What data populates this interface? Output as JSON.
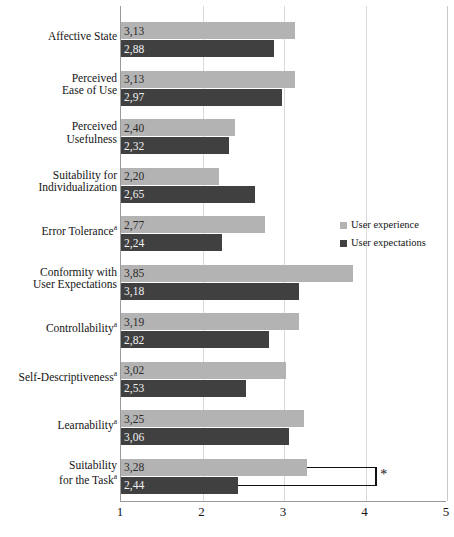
{
  "chart_data": {
    "type": "bar",
    "orientation": "horizontal",
    "title": "",
    "xlabel": "",
    "ylabel": "",
    "xlim": [
      1,
      5
    ],
    "xticks": [
      "1",
      "2",
      "3",
      "4",
      "5"
    ],
    "grid": true,
    "legend_position": "right-middle",
    "categories": [
      "Affective State",
      "Perceived\nEase of Use",
      "Perceived\nUsefulness",
      "Suitability for\nIndividualization",
      "Error Tolerance",
      "Conformity with\nUser Expectations",
      "Controllability",
      "Self-Descriptiveness",
      "Learnability",
      "Suitability\nfor the Task"
    ],
    "category_superscripts": [
      "",
      "",
      "",
      "",
      "a",
      "",
      "a",
      "a",
      "a",
      "a"
    ],
    "series": [
      {
        "name": "User experience",
        "color": "#b3b3b3",
        "values": [
          3.13,
          3.13,
          2.4,
          2.2,
          2.77,
          3.85,
          3.19,
          3.02,
          3.25,
          3.28
        ],
        "labels": [
          "3,13",
          "3,13",
          "2,40",
          "2,20",
          "2,77",
          "3,85",
          "3,19",
          "3,02",
          "3,25",
          "3,28"
        ]
      },
      {
        "name": "User expectations",
        "color": "#404040",
        "values": [
          2.88,
          2.97,
          2.32,
          2.65,
          2.24,
          3.18,
          2.82,
          2.53,
          3.06,
          2.44
        ],
        "labels": [
          "2,88",
          "2,97",
          "2,32",
          "2,65",
          "2,24",
          "3,18",
          "2,82",
          "2,53",
          "3,06",
          "2,44"
        ]
      }
    ],
    "annotations": [
      {
        "type": "significance-bracket",
        "category_index": 9,
        "label": "*",
        "from_value": 3.28,
        "to_value": 2.44,
        "bracket_end": 4.12
      }
    ]
  },
  "legend": {
    "items": [
      {
        "label": "User experience",
        "swatch": "experience-swatch"
      },
      {
        "label": "User expectations",
        "swatch": "expectations-swatch"
      }
    ]
  },
  "axis": {
    "ticks": [
      "1",
      "2",
      "3",
      "4",
      "5"
    ]
  }
}
